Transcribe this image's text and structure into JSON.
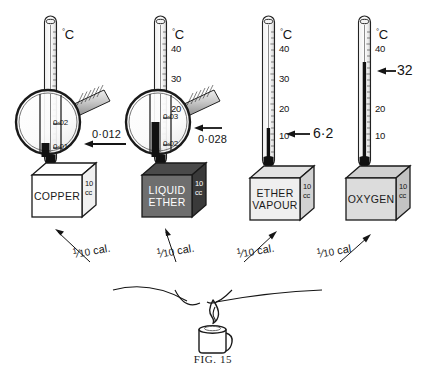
{
  "figure": {
    "caption_prefix": "F",
    "caption": "FIG. 15",
    "caption_lead": "F",
    "caption_rest": "IG. 15",
    "background_color": "#ffffff",
    "ink_color": "#141414"
  },
  "degree_unit": "C",
  "degree_symbol": "°",
  "stations": [
    {
      "id": "copper",
      "box_label": "COPPER",
      "box_volume": "10\ncc",
      "box_volume_line1": "10",
      "box_volume_line2": "cc",
      "box_fill_color": "#ffffff",
      "box_top_color": "#ffffff",
      "box_side_color": "#ffffff",
      "heat_label_numerator": "1",
      "heat_label_denominator": "10",
      "heat_label_unit": "cal.",
      "thermometer": {
        "unit": "°C",
        "tick_labels": [],
        "reading": null,
        "mercury_fraction": 0.04
      },
      "magnifier": {
        "present": true,
        "upper_gradation": "0·02",
        "lower_gradation": "0·01",
        "callout": "0·012"
      }
    },
    {
      "id": "liquid-ether",
      "box_label": "LIQUID\nETHER",
      "box_label_line1": "LIQUID",
      "box_label_line2": "ETHER",
      "box_volume_line1": "10",
      "box_volume_line2": "cc",
      "box_fill_color": "#6e6e6e",
      "box_top_color": "#4a4a4a",
      "box_side_color": "#3a3a3a",
      "heat_label_numerator": "1",
      "heat_label_denominator": "10",
      "heat_label_unit": "cal.",
      "thermometer": {
        "unit": "°C",
        "tick_labels": [
          "40",
          "30",
          "20"
        ],
        "reading": null,
        "mercury_fraction": 0.06
      },
      "magnifier": {
        "present": true,
        "upper_gradation": "0·03",
        "lower_gradation": "0·02",
        "callout": "0·028"
      }
    },
    {
      "id": "ether-vapour",
      "box_label": "ETHER\nVAPOUR",
      "box_label_line1": "ETHER",
      "box_label_line2": "VAPOUR",
      "box_volume_line1": "10",
      "box_volume_line2": "cc",
      "box_fill_color": "#efefef",
      "box_top_color": "#e2e2e2",
      "box_side_color": "#d2d2d2",
      "heat_label_numerator": "1",
      "heat_label_denominator": "10",
      "heat_label_unit": "cal.",
      "thermometer": {
        "unit": "°C",
        "tick_labels": [
          "40",
          "30",
          "20",
          "10"
        ],
        "reading": "6·2",
        "mercury_fraction": 0.14
      },
      "magnifier": {
        "present": false
      }
    },
    {
      "id": "oxygen",
      "box_label": "OXYGEN",
      "box_volume_line1": "10",
      "box_volume_line2": "cc",
      "box_fill_color": "#dcdcdc",
      "box_top_color": "#cfcfcf",
      "box_side_color": "#c2c2c2",
      "heat_label_numerator": "1",
      "heat_label_denominator": "10",
      "heat_label_unit": "cal",
      "thermometer": {
        "unit": "°C",
        "tick_labels": [
          "40",
          "20",
          "10"
        ],
        "reading": "32",
        "mercury_fraction": 0.72
      },
      "magnifier": {
        "present": false
      }
    }
  ],
  "burner": {
    "name": "spirit-burner",
    "flame": "flame"
  }
}
